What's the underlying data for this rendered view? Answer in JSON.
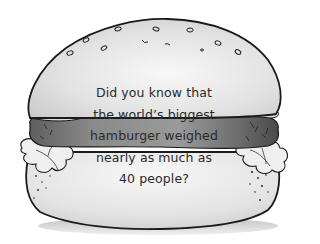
{
  "illustration": {
    "subject": "hamburger",
    "style": "black-and-white pencil drawing",
    "colors": {
      "bun": "#e4e4e4",
      "bun_highlight": "#f6f6f6",
      "patty": "#7c7c7c",
      "lettuce": "#eeeeee",
      "outline": "#1a1a1a",
      "shadow": "#bdbdbd",
      "text": "#2a2a2a"
    }
  },
  "caption": {
    "lines": [
      "Did you know that",
      "the world’s biggest",
      "hamburger weighed",
      "nearly as much as",
      "40 people?"
    ]
  }
}
